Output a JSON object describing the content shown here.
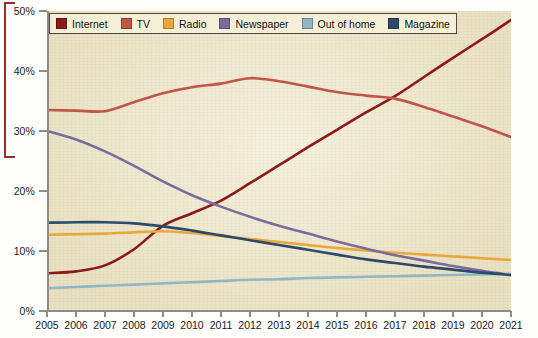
{
  "chart_data": {
    "type": "line",
    "title": "",
    "xlabel": "",
    "ylabel": "",
    "grid": false,
    "legend_position": "top-left",
    "x": [
      2005,
      2006,
      2007,
      2008,
      2009,
      2010,
      2011,
      2012,
      2013,
      2014,
      2015,
      2016,
      2017,
      2018,
      2019,
      2020,
      2021
    ],
    "categories": [
      "2005",
      "2006",
      "2007",
      "2008",
      "2009",
      "2010",
      "2011",
      "2012",
      "2013",
      "2014",
      "2015",
      "2016",
      "2017",
      "2018",
      "2019",
      "2020",
      "2021"
    ],
    "xlim": [
      2005,
      2021
    ],
    "ylim": [
      0,
      50
    ],
    "ytick_values": [
      0,
      10,
      20,
      30,
      40,
      50
    ],
    "ytick_labels": [
      "0%",
      "10%",
      "20%",
      "30%",
      "40%",
      "50%"
    ],
    "series": [
      {
        "name": "Internet",
        "color": "#8B1A1A",
        "values": [
          6.3,
          6.6,
          7.6,
          10.3,
          14.2,
          16.3,
          18.4,
          21.3,
          24.3,
          27.3,
          30.2,
          33.1,
          35.8,
          39.0,
          42.2,
          45.3,
          48.5
        ]
      },
      {
        "name": "TV",
        "color": "#C1554A",
        "values": [
          33.5,
          33.4,
          33.3,
          34.8,
          36.3,
          37.3,
          37.9,
          38.8,
          38.3,
          37.4,
          36.5,
          35.9,
          35.4,
          34.0,
          32.4,
          30.8,
          29.0
        ]
      },
      {
        "name": "Radio",
        "color": "#E8A93A",
        "values": [
          12.7,
          12.8,
          12.9,
          13.1,
          13.3,
          13.0,
          12.5,
          12.0,
          11.5,
          11.0,
          10.5,
          10.1,
          9.7,
          9.4,
          9.1,
          8.8,
          8.5
        ]
      },
      {
        "name": "Newspaper",
        "color": "#7B6B9E",
        "values": [
          30.0,
          28.6,
          26.6,
          24.2,
          21.6,
          19.3,
          17.4,
          15.7,
          14.2,
          12.9,
          11.6,
          10.4,
          9.3,
          8.4,
          7.5,
          6.7,
          6.0
        ]
      },
      {
        "name": "Out of home",
        "color": "#8FB8C4",
        "values": [
          3.8,
          4.0,
          4.2,
          4.4,
          4.6,
          4.8,
          5.0,
          5.2,
          5.3,
          5.5,
          5.6,
          5.7,
          5.8,
          5.9,
          6.0,
          6.1,
          6.2
        ]
      },
      {
        "name": "Magazine",
        "color": "#2E4A6B",
        "values": [
          14.7,
          14.8,
          14.8,
          14.6,
          14.1,
          13.4,
          12.6,
          11.8,
          11.0,
          10.2,
          9.4,
          8.6,
          8.0,
          7.4,
          6.9,
          6.4,
          6.0
        ]
      }
    ]
  },
  "legend": {
    "items": [
      {
        "label": "Internet",
        "color": "#8B1A1A"
      },
      {
        "label": "TV",
        "color": "#C1554A"
      },
      {
        "label": "Radio",
        "color": "#E8A93A"
      },
      {
        "label": "Newspaper",
        "color": "#7B6B9E"
      },
      {
        "label": "Out of home",
        "color": "#8FB8C4"
      },
      {
        "label": "Magazine",
        "color": "#2E4A6B"
      }
    ]
  },
  "axes": {
    "y_labels": [
      "50%",
      "40%",
      "30%",
      "20%",
      "10%",
      "0%"
    ],
    "x_labels": [
      "2005",
      "2006",
      "2007",
      "2008",
      "2009",
      "2010",
      "2011",
      "2012",
      "2013",
      "2014",
      "2015",
      "2016",
      "2017",
      "2018",
      "2019",
      "2020",
      "2021"
    ]
  },
  "colors": {
    "plot_background": "#f3ecd2",
    "page_background": "#fdfdfb",
    "axis": "#8d8d86",
    "legend_border": "#4a4a42",
    "legend_background": "#f6efd8",
    "bracket": "#9e2b2b"
  }
}
